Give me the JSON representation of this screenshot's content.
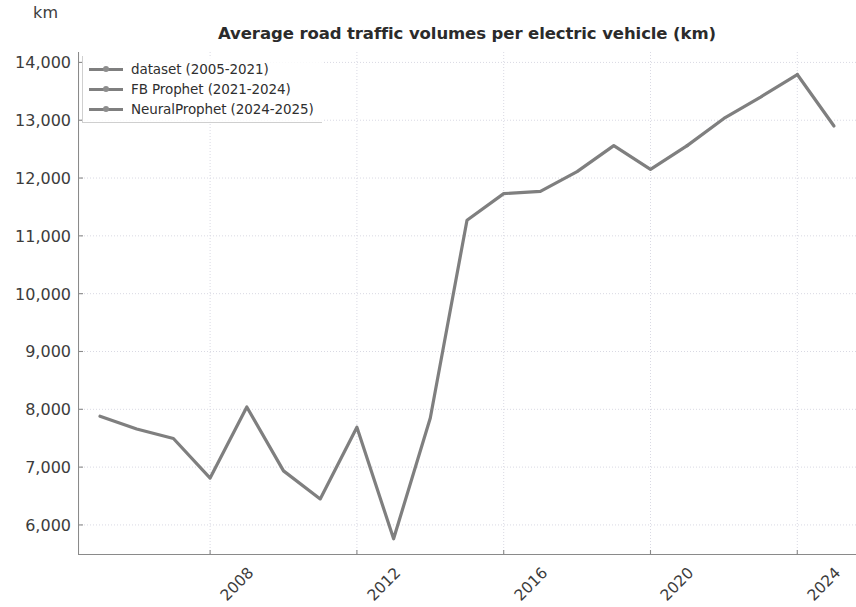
{
  "figure": {
    "y_unit_label": "km",
    "title": "Average road traffic volumes per electric vehicle (km)",
    "line_color": "#7f7f7f",
    "grid_color": "#d9d9e3",
    "axis_color": "#8a8a8a",
    "text_color": "#3c3c3c"
  },
  "legend": {
    "items": [
      {
        "label": "dataset (2005-2021)",
        "color": "#7f7f7f"
      },
      {
        "label": "FB Prophet (2021-2024)",
        "color": "#7f7f7f"
      },
      {
        "label": "NeuralProphet (2024-2025)",
        "color": "#7f7f7f"
      }
    ]
  },
  "chart_data": {
    "type": "line",
    "title": "Average road traffic volumes per electric vehicle (km)",
    "xlabel": "",
    "ylabel": "km",
    "xlim": [
      2004.4,
      2025.6
    ],
    "ylim": [
      5480,
      14180
    ],
    "grid": true,
    "legend_position": "upper left",
    "xticks": [
      2008,
      2012,
      2016,
      2020,
      2024
    ],
    "xtick_labels": [
      "2008",
      "2012",
      "2016",
      "2020",
      "2024"
    ],
    "yticks": [
      6000,
      7000,
      8000,
      9000,
      10000,
      11000,
      12000,
      13000,
      14000
    ],
    "ytick_labels": [
      "6,000",
      "7,000",
      "8,000",
      "9,000",
      "10,000",
      "11,000",
      "12,000",
      "13,000",
      "14,000"
    ],
    "x": [
      2005,
      2006,
      2007,
      2008,
      2009,
      2010,
      2011,
      2012,
      2013,
      2014,
      2015,
      2016,
      2017,
      2018,
      2019,
      2020,
      2021,
      2022,
      2023,
      2024,
      2025
    ],
    "series": [
      {
        "name": "dataset (2005-2021)",
        "x": [
          2005,
          2006,
          2007,
          2008,
          2009,
          2010,
          2011,
          2012,
          2013,
          2014,
          2015,
          2016,
          2017,
          2018,
          2019,
          2020,
          2021
        ],
        "values": [
          7880,
          7660,
          7495,
          6810,
          8040,
          6935,
          6450,
          7690,
          5760,
          7850,
          11270,
          11730,
          11770,
          12110,
          12560,
          12150,
          12560
        ]
      },
      {
        "name": "FB Prophet (2021-2024)",
        "x": [
          2021,
          2022,
          2023,
          2024
        ],
        "values": [
          12560,
          13030,
          13400,
          13790
        ]
      },
      {
        "name": "NeuralProphet (2024-2025)",
        "x": [
          2024,
          2025
        ],
        "values": [
          13790,
          12900
        ]
      }
    ]
  }
}
